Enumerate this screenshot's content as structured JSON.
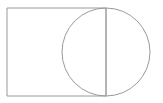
{
  "canvas": {
    "width": 163,
    "height": 103,
    "background_color": "#ffffff",
    "title": "Rectangle with overlapping circle"
  },
  "style": {
    "stroke_color": "#9a9a9a",
    "stroke_color_light": "#b4b4b4",
    "stroke_width": 1,
    "fill": "none"
  },
  "figure": {
    "shapes": [
      {
        "name": "rectangle",
        "type": "rect",
        "x": 7,
        "y": 8,
        "width": 99,
        "height": 88,
        "stroke": "#9a9a9a",
        "fill": "none"
      },
      {
        "name": "circle",
        "type": "circle",
        "cx": 106,
        "cy": 52,
        "r": 44,
        "stroke": "#9a9a9a",
        "fill": "none"
      },
      {
        "name": "shared-vertical-edge",
        "type": "line",
        "x1": 106,
        "y1": 8,
        "x2": 106,
        "y2": 96,
        "stroke": "#9a9a9a"
      }
    ]
  }
}
